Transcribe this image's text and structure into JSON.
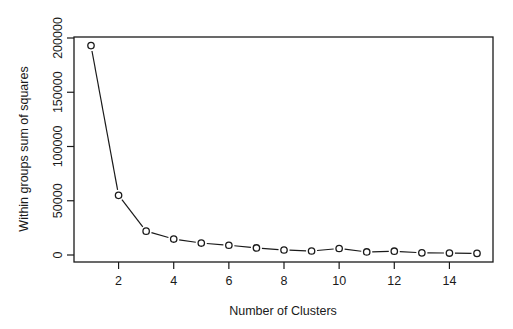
{
  "chart_data": {
    "type": "line",
    "title": "",
    "xlabel": "Number of Clusters",
    "ylabel": "Within groups sum of squares",
    "x": [
      1,
      2,
      3,
      4,
      5,
      6,
      7,
      8,
      9,
      10,
      11,
      12,
      13,
      14,
      15
    ],
    "series": [
      {
        "name": "wss",
        "values": [
          193000,
          55000,
          22000,
          14700,
          11000,
          9000,
          6500,
          4600,
          3700,
          6000,
          2800,
          3500,
          2000,
          1800,
          1500
        ]
      }
    ],
    "xlim": [
      0.44,
      15.6
    ],
    "ylim": [
      -6500,
      207500
    ],
    "x_ticks": [
      2,
      4,
      6,
      8,
      10,
      12,
      14
    ],
    "x_tick_labels": [
      "2",
      "4",
      "6",
      "8",
      "10",
      "12",
      "14"
    ],
    "y_ticks": [
      0,
      50000,
      100000,
      150000,
      200000
    ],
    "y_tick_labels": [
      "0",
      "50000",
      "100000",
      "150000",
      "200000"
    ],
    "grid": false,
    "legend": null,
    "marker": "open-circle",
    "line_style": "line-with-gaps-at-points"
  },
  "colors": {
    "line": "#1a1a1a",
    "background": "#ffffff"
  }
}
